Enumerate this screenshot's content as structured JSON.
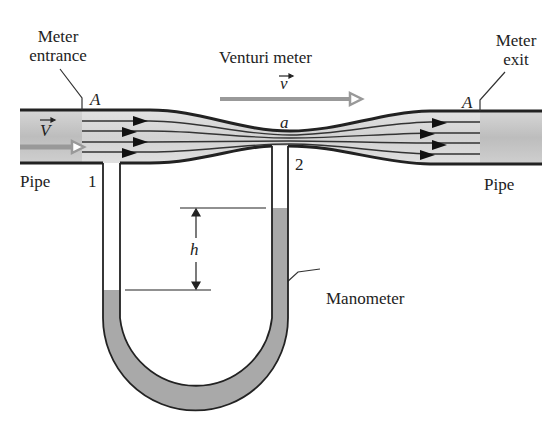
{
  "title": "Venturi meter",
  "labels": {
    "meter_entrance": [
      "Meter",
      "entrance"
    ],
    "meter_exit": [
      "Meter",
      "exit"
    ],
    "venturi_meter": "Venturi meter",
    "pipe_left": "Pipe",
    "pipe_right": "Pipe",
    "area_entrance": "A",
    "area_exit": "A",
    "area_throat": "a",
    "point_1": "1",
    "point_2": "2",
    "height": "h",
    "manometer": "Manometer",
    "velocity_pipe": "V",
    "velocity_throat": "v"
  },
  "colors": {
    "pipe_fill": "#c4c4c4",
    "meter_fill": "#d9d9d9",
    "fluid_fill": "#a9a9a9",
    "outline": "#222222",
    "arrow_gray": "#9a9a9a"
  }
}
